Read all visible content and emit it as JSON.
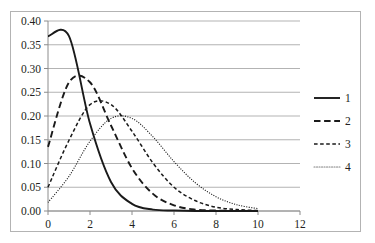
{
  "chart_data": {
    "type": "line",
    "title": "",
    "subtitle": "",
    "xlabel": "",
    "ylabel": "",
    "xlim": [
      0,
      12
    ],
    "ylim": [
      0,
      0.4
    ],
    "grid": true,
    "grid_axis": "y",
    "legend_position": "right",
    "x_ticks": [
      0,
      2,
      4,
      6,
      8,
      10,
      12
    ],
    "x_tick_labels": [
      "0",
      "2",
      "4",
      "6",
      "8",
      "10",
      "12"
    ],
    "y_ticks": [
      0.0,
      0.05,
      0.1,
      0.15,
      0.2,
      0.25,
      0.3,
      0.35,
      0.4
    ],
    "y_tick_labels": [
      "0.00",
      "0.05",
      "0.10",
      "0.15",
      "0.20",
      "0.25",
      "0.30",
      "0.35",
      "0.40"
    ],
    "x": [
      0,
      1,
      2,
      3,
      4,
      5,
      6,
      7,
      8,
      9,
      10
    ],
    "series": [
      {
        "name": "1",
        "legend_label": "1",
        "style": "solid",
        "stroke_width": 1.9,
        "color": "#1a1a1a",
        "values": [
          0.368,
          0.368,
          0.184,
          0.061,
          0.015,
          0.003,
          0.001,
          0.0,
          0.0,
          0.0,
          0.0
        ]
      },
      {
        "name": "2",
        "legend_label": "2",
        "style": "long-dash",
        "stroke_width": 1.9,
        "color": "#1a1a1a",
        "values": [
          0.135,
          0.271,
          0.271,
          0.18,
          0.09,
          0.036,
          0.012,
          0.003,
          0.001,
          0.0,
          0.0
        ]
      },
      {
        "name": "3",
        "legend_label": "3",
        "style": "short-dash",
        "stroke_width": 1.5,
        "color": "#1a1a1a",
        "values": [
          0.05,
          0.149,
          0.224,
          0.224,
          0.168,
          0.101,
          0.05,
          0.022,
          0.008,
          0.003,
          0.001
        ]
      },
      {
        "name": "4",
        "legend_label": "4",
        "style": "dotted",
        "stroke_width": 1.1,
        "color": "#808080",
        "values": [
          0.018,
          0.073,
          0.147,
          0.195,
          0.195,
          0.156,
          0.104,
          0.06,
          0.03,
          0.013,
          0.005
        ]
      }
    ]
  },
  "frame": {
    "border_color": "#b3b3b3",
    "background": "#ffffff"
  }
}
